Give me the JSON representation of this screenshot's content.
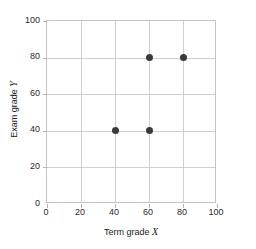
{
  "chart_data": {
    "type": "scatter",
    "title": "",
    "xlabel": "Term grade X",
    "ylabel": "Exam grade Y",
    "xlabel_text": "Term grade",
    "xlabel_var": "X",
    "ylabel_text": "Exam grade",
    "ylabel_var": "Y",
    "xlim": [
      0,
      100
    ],
    "ylim": [
      0,
      100
    ],
    "xticks": [
      0,
      20,
      40,
      60,
      80,
      100
    ],
    "yticks": [
      0,
      20,
      40,
      60,
      80,
      100
    ],
    "xtick_labels": [
      "0",
      "20",
      "40",
      "60",
      "80",
      "100"
    ],
    "ytick_labels": [
      "0",
      "20",
      "40",
      "60",
      "80",
      "100"
    ],
    "ytick_labels_shown": [
      "20",
      "40",
      "60",
      "80",
      "100"
    ],
    "grid": true,
    "legend": false,
    "points": [
      {
        "x": 40,
        "y": 40
      },
      {
        "x": 60,
        "y": 40
      },
      {
        "x": 60,
        "y": 80
      },
      {
        "x": 80,
        "y": 80
      }
    ],
    "x": [
      40,
      60,
      60,
      80
    ],
    "y": [
      40,
      40,
      80,
      80
    ],
    "marker_color": "#3a3a3a",
    "grid_color": "#cfcfcf",
    "frame_color": "#c4c4c4",
    "background_color": "#ffffff"
  }
}
